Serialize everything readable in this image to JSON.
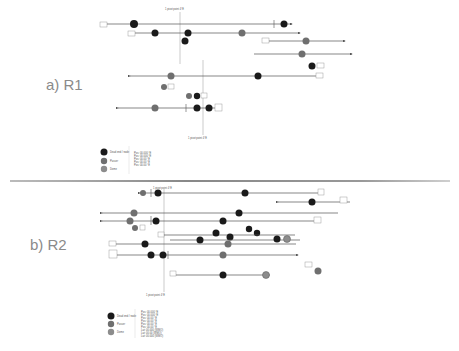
{
  "panels": [
    {
      "id": "r1",
      "label": "a) R1"
    },
    {
      "id": "r2",
      "label": "b) R2"
    }
  ],
  "colors": {
    "node_dark": "#1a1a1a",
    "node_mid": "#6f6f6f",
    "node_light": "#8c8c8c",
    "line": "#555555",
    "divider": "#999999"
  },
  "r1": {
    "pivot_label": "1 pivot point 4°E",
    "pivot_label_bottom": "1 pivot point 4°E",
    "legend": {
      "items": [
        {
          "name": "Dead end / node",
          "kind": "dark"
        },
        {
          "name": "Passer",
          "kind": "mid"
        },
        {
          "name": "Dome",
          "kind": "light"
        }
      ],
      "notes": [
        "Pos: 00.000 °E",
        "Pos: 00.000 °E",
        "Pos: 00.00 °E",
        "Pos: 00.00 °E",
        "Pos: 00.00 °E"
      ]
    }
  },
  "r2": {
    "pivot_label": "1 pivot point 4°E",
    "pivot_label_bottom": "1 pivot point 4°E",
    "legend": {
      "items": [
        {
          "name": "Dead end / node",
          "kind": "dark"
        },
        {
          "name": "Passer",
          "kind": "mid"
        },
        {
          "name": "Dome",
          "kind": "light"
        }
      ],
      "notes": [
        "Pos: 00.000 °E",
        "Pos: 00.000 °E",
        "Pos: 00.00 °E",
        "Pos: 00.00 °E",
        "Pos: 00.00 °E",
        "Pos: 00.00 °E",
        "Lat: 00.000 (WMO)",
        "Lat: 00.00 (WMO)",
        "Lat: 00.000 (WMO)"
      ]
    }
  }
}
